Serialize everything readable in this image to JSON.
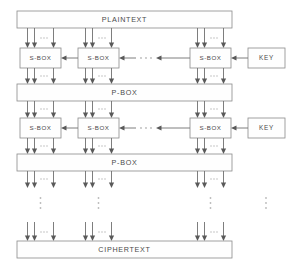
{
  "diagram": {
    "type": "block-cipher-spn",
    "canvas": {
      "width": 293,
      "height": 271,
      "background": "#ffffff"
    },
    "colors": {
      "box_stroke": "#8a8a8a",
      "box_fill": "#fefefe",
      "wire": "#6f6f6f",
      "text": "#4a4a4a",
      "ellipsis": "#b9b9b9"
    },
    "labels": {
      "plaintext": "PLAINTEXT",
      "ciphertext": "CIPHERTEXT",
      "pbox": "P-BOX",
      "sbox": "S-BOX",
      "key": "KEY"
    },
    "rows": [
      {
        "kind": "wide-box",
        "name": "plaintext",
        "label": "PLAINTEXT",
        "x": 17,
        "y": 11,
        "w": 215,
        "h": 17
      },
      {
        "kind": "sbox-row",
        "name": "round-1-substitution",
        "label": "S-BOX",
        "y": 48,
        "h": 20,
        "key_label": "KEY"
      },
      {
        "kind": "wide-box",
        "name": "pbox-1",
        "label": "P-BOX",
        "x": 17,
        "y": 84,
        "w": 215,
        "h": 17
      },
      {
        "kind": "sbox-row",
        "name": "round-2-substitution",
        "label": "S-BOX",
        "y": 118,
        "h": 20,
        "key_label": "KEY"
      },
      {
        "kind": "wide-box",
        "name": "pbox-2",
        "label": "P-BOX",
        "x": 17,
        "y": 154,
        "w": 215,
        "h": 17
      },
      {
        "kind": "vertical-ellipsis",
        "name": "rounds-continue"
      },
      {
        "kind": "wide-box",
        "name": "ciphertext",
        "label": "CIPHERTEXT",
        "x": 17,
        "y": 241,
        "w": 215,
        "h": 17
      }
    ],
    "sbox_columns": [
      {
        "name": "sbox-column-1",
        "x": 20,
        "w": 41,
        "bus_center": 40.5
      },
      {
        "name": "sbox-column-2",
        "x": 78,
        "w": 41,
        "bus_center": 98.5
      },
      {
        "name": "sbox-column-3",
        "x": 190,
        "w": 41,
        "bus_center": 210.5
      }
    ],
    "key_boxes": [
      {
        "name": "key-box-round-1",
        "label": "KEY",
        "x": 248,
        "y": 48,
        "w": 37,
        "h": 20
      },
      {
        "name": "key-box-round-2",
        "label": "KEY",
        "x": 248,
        "y": 118,
        "w": 37,
        "h": 20
      }
    ],
    "bus": {
      "wires_per_group": 3,
      "wire_offsets": [
        -13,
        -6,
        13
      ],
      "inline_ellipsis_offset": 3.5
    },
    "horizontal_ellipsis_x": 152,
    "vertical_ellipsis_x": [
      40.5,
      98.5,
      210.5,
      266
    ],
    "vertical_ellipsis_y": 203
  }
}
